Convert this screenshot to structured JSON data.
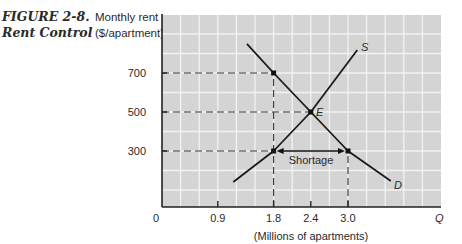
{
  "figure": {
    "number": "FIGURE 2-8.",
    "title": "Rent Control"
  },
  "axes": {
    "ylabel_line1": "Monthly rent",
    "ylabel_line2": "($/apartment)",
    "xlabel": "(Millions of apartments)",
    "x_axis_symbol": "Q",
    "x_origin_label": "0"
  },
  "annotations": {
    "shortage": "Shortage",
    "equilibrium": "E",
    "supply": "S",
    "demand": "D"
  },
  "chart_data": {
    "type": "line",
    "title": "FIGURE 2-8. Rent Control",
    "xlabel": "(Millions of apartments)",
    "ylabel": "Monthly rent ($/apartment)",
    "x_ticks": [
      0,
      0.9,
      1.8,
      2.4,
      3.0
    ],
    "x_tick_labels": [
      "0",
      "0.9",
      "1.8",
      "2.4",
      "3.0"
    ],
    "y_ticks": [
      300,
      500,
      700
    ],
    "y_tick_labels": [
      "300",
      "500",
      "700"
    ],
    "xlim": [
      0,
      4.5
    ],
    "ylim": [
      0,
      1000
    ],
    "grid": true,
    "legend": "none (curves labeled inline)",
    "series": [
      {
        "name": "D",
        "label": "Demand",
        "x": [
          1.37,
          1.8,
          2.4,
          3.0,
          3.69
        ],
        "y": [
          849,
          700,
          500,
          300,
          146
        ]
      },
      {
        "name": "S",
        "label": "Supply",
        "x": [
          1.15,
          1.8,
          2.4,
          3.15
        ],
        "y": [
          141,
          300,
          500,
          818
        ]
      }
    ],
    "points": [
      {
        "label": "E",
        "x": 2.4,
        "y": 500,
        "note": "Equilibrium"
      },
      {
        "label": "",
        "x": 1.8,
        "y": 700,
        "note": "Demand price at rent-controlled quantity"
      },
      {
        "label": "",
        "x": 1.8,
        "y": 300,
        "note": "Quantity supplied at controlled rent"
      },
      {
        "label": "",
        "x": 3.0,
        "y": 300,
        "note": "Quantity demanded at controlled rent"
      }
    ],
    "reference_lines": [
      {
        "type": "dashed-horizontal",
        "y": 700,
        "x_from": 0,
        "x_to": 1.8
      },
      {
        "type": "dashed-horizontal",
        "y": 500,
        "x_from": 0,
        "x_to": 2.4
      },
      {
        "type": "dashed-horizontal",
        "y": 300,
        "x_from": 0,
        "x_to": 1.8
      },
      {
        "type": "dashed-vertical",
        "x": 1.8,
        "y_from": 0,
        "y_to": 700
      },
      {
        "type": "dashed-vertical",
        "x": 3.0,
        "y_from": 0,
        "y_to": 300
      }
    ],
    "annotations": [
      {
        "text": "Shortage",
        "type": "double-arrow",
        "x_from": 1.8,
        "x_to": 3.0,
        "y": 300
      }
    ],
    "price_ceiling": 300
  }
}
